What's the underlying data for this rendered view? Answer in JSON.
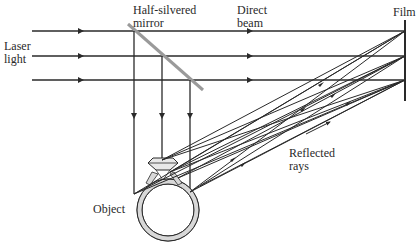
{
  "diagram": {
    "labels": {
      "laser": "Laser\nlight",
      "mirror": "Half-silvered\nmirror",
      "direct": "Direct\nbeam",
      "film": "Film",
      "reflected": "Reflected\nrays",
      "object": "Object"
    },
    "colors": {
      "line": "#2a2a2a",
      "mirror": "#9a9a9a",
      "ring_fill": "#d8d8d8",
      "background": "#ffffff"
    },
    "beams_y": [
      31,
      56,
      80
    ],
    "film_x": 405
  }
}
